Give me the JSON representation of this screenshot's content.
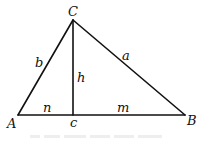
{
  "diagram": {
    "points": {
      "A": {
        "x": 18,
        "y": 115
      },
      "B": {
        "x": 185,
        "y": 115
      },
      "C": {
        "x": 73,
        "y": 20
      },
      "foot": {
        "x": 73,
        "y": 115
      }
    },
    "labels": {
      "vertex_C": "C",
      "vertex_A": "A",
      "vertex_B": "B",
      "side_b": "b",
      "side_a": "a",
      "altitude_h": "h",
      "segment_n": "n",
      "segment_m": "m",
      "side_c": "c"
    },
    "caption": "",
    "colors": {
      "stroke": "#111111",
      "background": "#ffffff"
    }
  }
}
